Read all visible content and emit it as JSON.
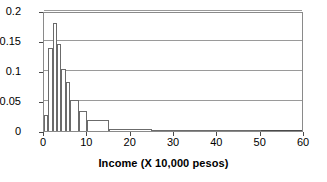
{
  "chart_data": {
    "type": "bar",
    "title": "",
    "subtitle": "",
    "xlabel": "Income (X 10,000 pesos)",
    "ylabel": "",
    "xlim": [
      0,
      60
    ],
    "ylim": [
      0,
      0.2
    ],
    "grid": true,
    "legend": false,
    "legend_position": "none",
    "x_ticks": [
      {
        "value": 0,
        "label": "0"
      },
      {
        "value": 10,
        "label": "10"
      },
      {
        "value": 20,
        "label": "20"
      },
      {
        "value": 30,
        "label": "30"
      },
      {
        "value": 40,
        "label": "40"
      },
      {
        "value": 50,
        "label": "50"
      },
      {
        "value": 60,
        "label": "60"
      }
    ],
    "y_ticks": [
      {
        "value": 0,
        "label": "0"
      },
      {
        "value": 0.05,
        "label": "0.05"
      },
      {
        "value": 0.1,
        "label": "0.1"
      },
      {
        "value": 0.15,
        "label": "0.15"
      },
      {
        "value": 0.2,
        "label": "0.2"
      }
    ],
    "bins": [
      {
        "x0": 0,
        "x1": 1,
        "value": 0.026
      },
      {
        "x0": 1,
        "x1": 2,
        "value": 0.138
      },
      {
        "x0": 2,
        "x1": 3,
        "value": 0.18
      },
      {
        "x0": 3,
        "x1": 4,
        "value": 0.145
      },
      {
        "x0": 4,
        "x1": 5,
        "value": 0.104
      },
      {
        "x0": 5,
        "x1": 6,
        "value": 0.082
      },
      {
        "x0": 6,
        "x1": 8,
        "value": 0.052
      },
      {
        "x0": 8,
        "x1": 10,
        "value": 0.033
      },
      {
        "x0": 10,
        "x1": 15,
        "value": 0.018
      },
      {
        "x0": 15,
        "x1": 25,
        "value": 0.004
      },
      {
        "x0": 25,
        "x1": 50,
        "value": 0.001
      }
    ],
    "categories": [
      "0-1",
      "1-2",
      "2-3",
      "3-4",
      "4-5",
      "5-6",
      "6-8",
      "8-10",
      "10-15",
      "15-25",
      "25-50"
    ],
    "values": [
      0.026,
      0.138,
      0.18,
      0.145,
      0.104,
      0.082,
      0.052,
      0.033,
      0.018,
      0.004,
      0.001
    ],
    "colors": {
      "bar_fill": "#ffffff",
      "bar_stroke": "#6b6b6b",
      "gridline": "#9a9a9a",
      "axis": "#4a4a4a",
      "frame": "#8a8a8a",
      "text": "#000000",
      "background": "#ffffff"
    }
  }
}
